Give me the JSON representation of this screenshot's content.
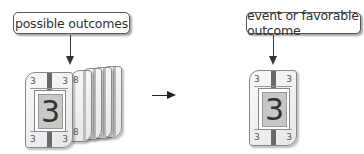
{
  "diagram": {
    "left": {
      "label": "possible outcomes",
      "front_card": {
        "value": "3",
        "corners": [
          "3",
          "3",
          "3",
          "3"
        ]
      },
      "stacked_cards": [
        {
          "top": "6",
          "bottom": "6"
        },
        {
          "top": "2",
          "bottom": "2"
        },
        {
          "top": "5",
          "bottom": "5"
        },
        {
          "top": "8",
          "bottom": "8"
        }
      ]
    },
    "transition_arrow": "right-arrow",
    "right": {
      "label": "event or favorable outcome",
      "card": {
        "value": "3",
        "corners": [
          "3",
          "3",
          "3",
          "3"
        ]
      }
    },
    "colors": {
      "stroke": "#333333",
      "card_face": "#c8c8c8",
      "card_stripe": "#6a6a6a",
      "background": "#ffffff"
    }
  }
}
